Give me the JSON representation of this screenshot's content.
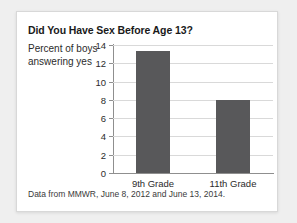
{
  "card": {
    "source_note": "Data from MMWR, June 8, 2012 and June 13, 2014."
  },
  "chart_data": {
    "type": "bar",
    "title": "Did You Have Sex Before Age 13?",
    "ylabel": "Percent of boys answering yes",
    "ylabel_lines": [
      "Percent of boys",
      "answering yes"
    ],
    "xlabel": "",
    "categories": [
      "9th Grade",
      "11th Grade"
    ],
    "values": [
      13.3,
      8.0
    ],
    "ylim": [
      0,
      14
    ],
    "yticks": [
      0,
      2,
      4,
      6,
      8,
      10,
      12,
      14
    ],
    "ytick_labels": [
      "0",
      "2",
      "4",
      "6",
      "8",
      "10",
      "12",
      "14"
    ],
    "grid": true,
    "legend": false,
    "bar_color": "#58585a",
    "grid_color": "#d9d9d9",
    "axis_color": "#8f8f8f"
  }
}
